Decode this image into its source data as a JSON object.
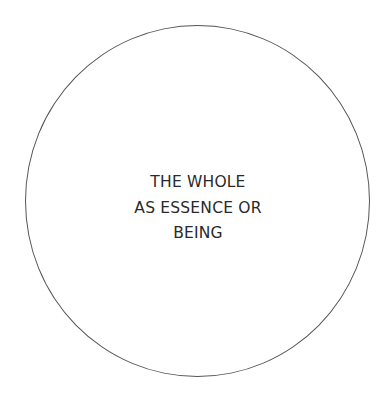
{
  "diagram": {
    "shape": "circle",
    "stroke_color": "#555555",
    "text_color": "#2a2a2a",
    "label_lines": [
      "THE WHOLE",
      "AS ESSENCE OR",
      "BEING"
    ]
  }
}
